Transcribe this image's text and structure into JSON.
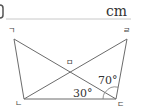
{
  "answer_box": {
    "unit": "cm"
  },
  "figure": {
    "vertices": {
      "a": {
        "label": "ㄱ",
        "x": 14,
        "y": 39
      },
      "b": {
        "label": "ㄴ",
        "x": 24,
        "y": 99
      },
      "c": {
        "label": "ㄷ",
        "x": 116,
        "y": 99
      },
      "d": {
        "label": "ㄹ",
        "x": 127,
        "y": 39
      },
      "e": {
        "label": "ㅁ",
        "x": 69,
        "y": 73
      }
    },
    "angles": {
      "angle_dbc": "30°",
      "angle_bcd_upper": "70°"
    },
    "colors": {
      "line": "#6b6b6b",
      "text": "#333333"
    }
  }
}
